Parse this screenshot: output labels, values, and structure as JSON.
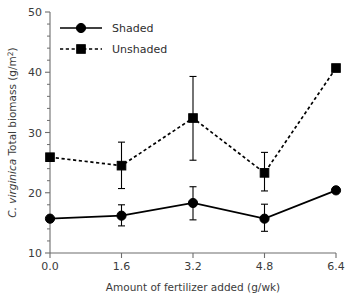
{
  "chart_data": {
    "type": "line",
    "title": "",
    "subtitle": "",
    "xlabel": "Amount of fertilizer added (g/wk)",
    "ylabel": "C. virginica Total biomass (g/m2)",
    "ylabel_italic_part": "C. virginica",
    "ylabel_roman_part": " Total biomass (g/m",
    "ylabel_superscript": "2",
    "ylabel_tail": ")",
    "x": [
      0.0,
      1.6,
      3.2,
      4.8,
      6.4
    ],
    "xtick_labels": [
      "0.0",
      "1.6",
      "3.2",
      "4.8",
      "6.4"
    ],
    "ytick_labels": [
      "10",
      "20",
      "30",
      "40",
      "50"
    ],
    "yticks": [
      10,
      20,
      30,
      40,
      50
    ],
    "yminor_step": 2,
    "xlim": [
      0.0,
      6.4
    ],
    "ylim": [
      10,
      50
    ],
    "grid": false,
    "legend_position": "top-left",
    "series": [
      {
        "name": "Shaded",
        "marker": "circle",
        "linestyle": "solid",
        "color": "#000000",
        "values": [
          15.7,
          16.2,
          18.3,
          15.7,
          20.4
        ],
        "err_low": [
          15.7,
          14.5,
          15.5,
          13.6,
          20.4
        ],
        "err_high": [
          15.7,
          18.0,
          21.0,
          18.1,
          20.4
        ]
      },
      {
        "name": "Unshaded",
        "marker": "square",
        "linestyle": "dashed",
        "color": "#000000",
        "values": [
          25.9,
          24.5,
          32.4,
          23.3,
          40.7
        ],
        "err_low": [
          25.9,
          20.7,
          25.4,
          20.3,
          40.7
        ],
        "err_high": [
          25.9,
          28.4,
          39.3,
          26.7,
          40.7
        ]
      }
    ],
    "legend_entries": [
      {
        "label": "Shaded",
        "marker": "circle",
        "linestyle": "solid"
      },
      {
        "label": "Unshaded",
        "marker": "square",
        "linestyle": "dashed"
      }
    ]
  }
}
